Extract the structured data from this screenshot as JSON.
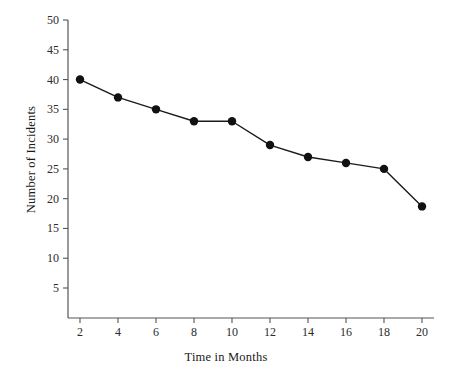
{
  "chart_data": {
    "type": "line",
    "title": "",
    "xlabel": "Time in Months",
    "ylabel": "Number of Incidents",
    "x": [
      2,
      4,
      6,
      8,
      10,
      12,
      14,
      16,
      18,
      20
    ],
    "values": [
      40,
      37,
      35,
      33,
      33,
      29,
      27,
      26,
      25,
      18.7
    ],
    "series": [
      {
        "name": "Number of Incidents",
        "values": [
          40,
          37,
          35,
          33,
          33,
          29,
          27,
          26,
          25,
          18.7
        ]
      }
    ],
    "xlim": [
      0,
      21
    ],
    "ylim": [
      0,
      51
    ],
    "xticks": [
      2,
      4,
      6,
      8,
      10,
      12,
      14,
      16,
      18,
      20
    ],
    "yticks": [
      5,
      10,
      15,
      20,
      25,
      30,
      35,
      40,
      45,
      50
    ],
    "xtick_labels": [
      "2",
      "4",
      "6",
      "8",
      "10",
      "12",
      "14",
      "16",
      "18",
      "20"
    ],
    "ytick_labels": [
      "5",
      "10",
      "15",
      "20",
      "25",
      "30",
      "35",
      "40",
      "45",
      "50"
    ],
    "grid": false,
    "legend": false,
    "legend_position": "none",
    "marker": "filled-circle",
    "line_color": "#1a1a1a",
    "marker_color": "#111111",
    "axis_color": "#555555",
    "background": "#ffffff"
  },
  "axes": {
    "x_title": "Time in Months",
    "y_title": "Number of Incidents"
  }
}
